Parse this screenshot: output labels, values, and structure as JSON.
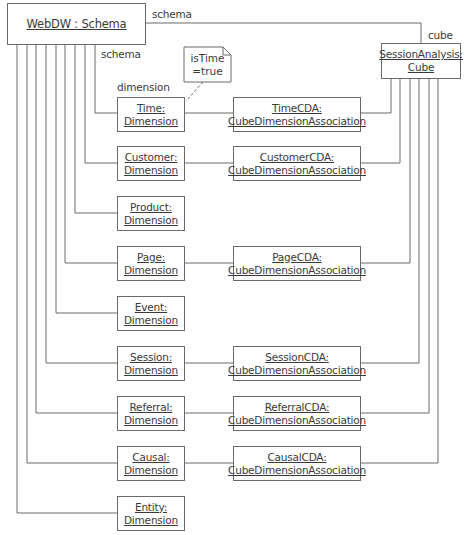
{
  "diagram": {
    "type": "UML object diagram",
    "schema": {
      "line1": "WebDW : Schema"
    },
    "cube": {
      "line1": "SessionAnalysis:",
      "line2": "Cube"
    },
    "role_labels": {
      "schema_top": "schema",
      "cube": "cube",
      "schema_left": "schema",
      "dimension": "dimension"
    },
    "note": {
      "line1": "isTime",
      "line2": "=true"
    },
    "dimensions": [
      {
        "line1": "Time:",
        "line2": "Dimension"
      },
      {
        "line1": "Customer:",
        "line2": "Dimension"
      },
      {
        "line1": "Product:",
        "line2": "Dimension"
      },
      {
        "line1": "Page:",
        "line2": "Dimension"
      },
      {
        "line1": "Event:",
        "line2": "Dimension"
      },
      {
        "line1": "Session:",
        "line2": "Dimension"
      },
      {
        "line1": "Referral:",
        "line2": "Dimension"
      },
      {
        "line1": "Causal:",
        "line2": "Dimension"
      },
      {
        "line1": "Entity:",
        "line2": "Dimension"
      }
    ],
    "associations": [
      {
        "line1": "TimeCDA:",
        "line2": "CubeDimensionAssociation"
      },
      {
        "line1": "CustomerCDA:",
        "line2": "CubeDimensionAssociation"
      },
      {
        "line1": "PageCDA:",
        "line2": "CubeDimensionAssociation"
      },
      {
        "line1": "SessionCDA:",
        "line2": "CubeDimensionAssociation"
      },
      {
        "line1": "ReferralCDA:",
        "line2": "CubeDimensionAssociation"
      },
      {
        "line1": "CausalCDA:",
        "line2": "CubeDimensionAssociation"
      }
    ],
    "colors": {
      "line": "#6a6a6a",
      "text": "#3a3a3a",
      "background": "#ffffff"
    }
  }
}
